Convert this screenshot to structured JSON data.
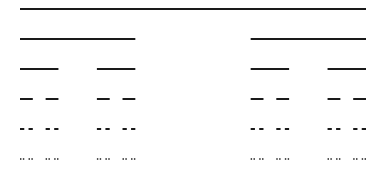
{
  "diagram": {
    "type": "cantor-set",
    "levels": 6,
    "x_start": 20,
    "x_end": 366,
    "y_start": 9,
    "row_spacing": 30,
    "stroke_color": "#1a1a1a",
    "stroke_widths": [
      2,
      2,
      2,
      2,
      2,
      1.5
    ],
    "background": "#ffffff"
  }
}
